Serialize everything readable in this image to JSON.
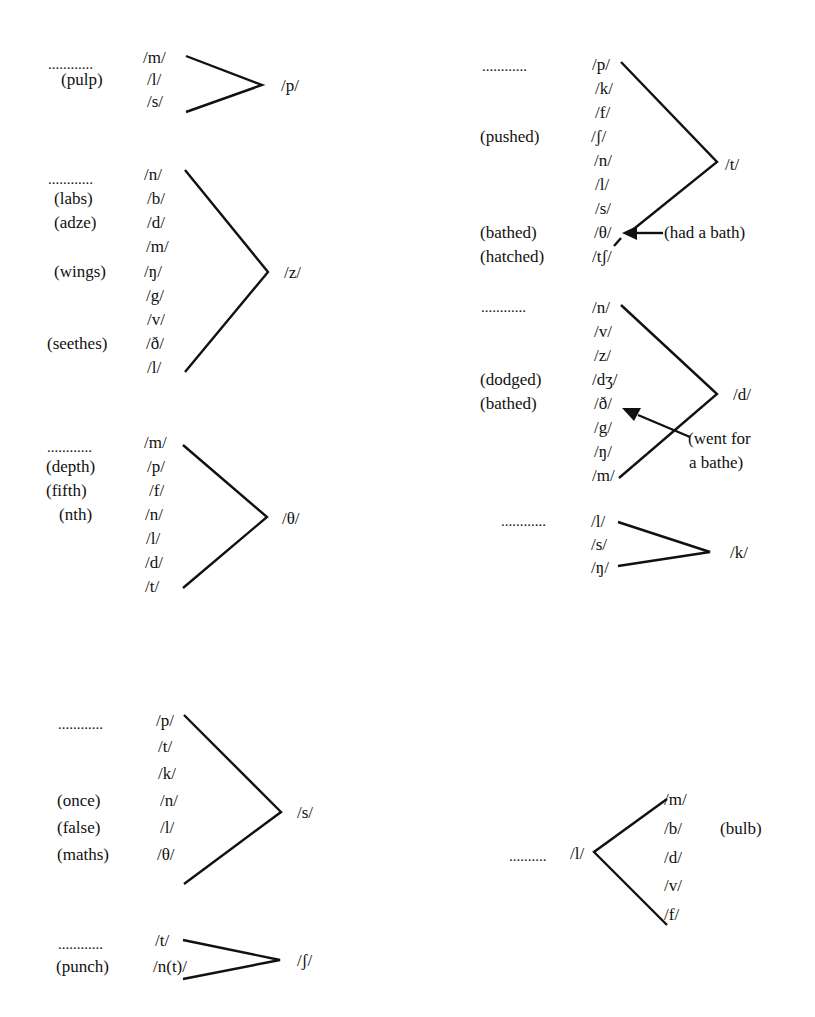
{
  "figure": {
    "type": "phonological consonant-cluster diagrams",
    "clusters": [
      {
        "id": "p",
        "target": "/p/",
        "leader": "............",
        "preceding": [
          "/m/",
          "/l/",
          "/s/"
        ],
        "examples": [
          {
            "phoneme": "/l/",
            "word": "(pulp)"
          }
        ]
      },
      {
        "id": "z",
        "target": "/z/",
        "leader": "............",
        "preceding": [
          "/n/",
          "/b/",
          "/d/",
          "/m/",
          "/ŋ/",
          "/g/",
          "/v/",
          "/ð/",
          "/l/"
        ],
        "examples": [
          {
            "phoneme": "/b/",
            "word": "(labs)"
          },
          {
            "phoneme": "/d/",
            "word": "(adze)"
          },
          {
            "phoneme": "/ŋ/",
            "word": "(wings)"
          },
          {
            "phoneme": "/ð/",
            "word": "(seethes)"
          }
        ]
      },
      {
        "id": "theta",
        "target": "/θ/",
        "leader": "............",
        "preceding": [
          "/m/",
          "/p/",
          "/f/",
          "/n/",
          "/l/",
          "/d/",
          "/t/"
        ],
        "examples": [
          {
            "phoneme": "/p/",
            "word": "(depth)"
          },
          {
            "phoneme": "/f/",
            "word": "(fifth)"
          },
          {
            "phoneme": "/n/",
            "word": "(nth)"
          }
        ]
      },
      {
        "id": "t",
        "target": "/t/",
        "leader": "............",
        "preceding": [
          "/p/",
          "/k/",
          "/f/",
          "/ʃ/",
          "/n/",
          "/l/",
          "/s/",
          "/θ/",
          "/tʃ/"
        ],
        "examples": [
          {
            "phoneme": "/ʃ/",
            "word": "(pushed)"
          },
          {
            "phoneme": "/θ/",
            "word": "(bathed)"
          },
          {
            "phoneme": "/tʃ/",
            "word": "(hatched)"
          }
        ],
        "annotation": {
          "text": "(had a bath)",
          "points_to": "/θ/"
        }
      },
      {
        "id": "d",
        "target": "/d/",
        "leader": "............",
        "preceding": [
          "/n/",
          "/v/",
          "/z/",
          "/dʒ/",
          "/ð/",
          "/g/",
          "/ŋ/",
          "/m/"
        ],
        "examples": [
          {
            "phoneme": "/dʒ/",
            "word": "(dodged)"
          },
          {
            "phoneme": "/ð/",
            "word": "(bathed)"
          }
        ],
        "annotation": {
          "line1": "(went for",
          "line2": "a bathe)",
          "points_to": "/ð/"
        }
      },
      {
        "id": "k",
        "target": "/k/",
        "leader": "............",
        "preceding": [
          "/l/",
          "/s/",
          "/ŋ/"
        ],
        "examples": []
      },
      {
        "id": "s",
        "target": "/s/",
        "leader": "............",
        "preceding": [
          "/p/",
          "/t/",
          "/k/",
          "/n/",
          "/l/",
          "/θ/"
        ],
        "examples": [
          {
            "phoneme": "/n/",
            "word": "(once)"
          },
          {
            "phoneme": "/l/",
            "word": "(false)"
          },
          {
            "phoneme": "/θ/",
            "word": "(maths)"
          }
        ]
      },
      {
        "id": "esh",
        "target": "/ʃ/",
        "leader": "............",
        "preceding": [
          "/t/",
          "/n(t)/"
        ],
        "examples": [
          {
            "phoneme": "/n(t)/",
            "word": "(punch)"
          }
        ]
      },
      {
        "id": "l-following",
        "source": "/l/",
        "leader": "..........",
        "following": [
          "/m/",
          "/b/",
          "/d/",
          "/v/",
          "/f/"
        ],
        "examples": [
          {
            "phoneme": "/b/",
            "word": "(bulb)"
          }
        ]
      }
    ]
  }
}
